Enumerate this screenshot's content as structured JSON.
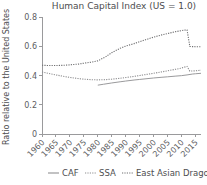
{
  "chart_data": {
    "type": "line",
    "title": "Human Capital Index (US = 1.0)",
    "xlabel": "",
    "ylabel": "Ratio relative to the United States",
    "xlim": [
      1960,
      2017
    ],
    "ylim": [
      0,
      0.8
    ],
    "xticks": [
      1960,
      1965,
      1970,
      1975,
      1980,
      1985,
      1990,
      1995,
      2000,
      2005,
      2010,
      2015
    ],
    "xtick_labels": [
      "1960",
      "1965",
      "1970",
      "1975",
      "1980",
      "1985",
      "1990",
      "1995",
      "2000",
      "2005",
      "2010",
      "2015"
    ],
    "yticks": [
      0,
      0.2,
      0.4,
      0.6,
      0.8
    ],
    "ytick_labels": [
      "0",
      "0.2",
      "0.4",
      "0.6",
      "0.8"
    ],
    "grid": false,
    "legend_position": "bottom",
    "series": [
      {
        "name": "CAF",
        "style": "solid",
        "color": "#9a9a9c",
        "x": [
          1980,
          1982,
          1985,
          1988,
          1990,
          1993,
          1995,
          1998,
          2000,
          2003,
          2005,
          2008,
          2010,
          2012,
          2014,
          2015,
          2017
        ],
        "values": [
          0.334,
          0.34,
          0.349,
          0.357,
          0.362,
          0.369,
          0.373,
          0.379,
          0.383,
          0.388,
          0.391,
          0.396,
          0.399,
          0.404,
          0.41,
          0.412,
          0.415
        ]
      },
      {
        "name": "SSA",
        "style": "dotted",
        "color": "#8e8e90",
        "x": [
          1960,
          1963,
          1965,
          1968,
          1970,
          1973,
          1975,
          1978,
          1980,
          1983,
          1985,
          1988,
          1990,
          1993,
          1995,
          1998,
          2000,
          2003,
          2005,
          2008,
          2010,
          2011,
          2012,
          2013,
          2015,
          2017
        ],
        "values": [
          0.424,
          0.412,
          0.404,
          0.393,
          0.387,
          0.379,
          0.375,
          0.371,
          0.37,
          0.372,
          0.375,
          0.381,
          0.386,
          0.394,
          0.4,
          0.409,
          0.415,
          0.425,
          0.432,
          0.443,
          0.451,
          0.457,
          0.462,
          0.43,
          0.432,
          0.436
        ]
      },
      {
        "name": "East Asian Dragons",
        "style": "dotted",
        "color": "#6f6f71",
        "x": [
          1960,
          1963,
          1965,
          1968,
          1970,
          1973,
          1975,
          1978,
          1980,
          1983,
          1985,
          1988,
          1990,
          1993,
          1995,
          1998,
          2000,
          2003,
          2005,
          2008,
          2010,
          2011,
          2012,
          2013,
          2015,
          2017
        ],
        "values": [
          0.47,
          0.468,
          0.468,
          0.47,
          0.473,
          0.478,
          0.484,
          0.492,
          0.5,
          0.53,
          0.556,
          0.586,
          0.601,
          0.618,
          0.631,
          0.65,
          0.662,
          0.678,
          0.687,
          0.7,
          0.707,
          0.71,
          0.712,
          0.598,
          0.597,
          0.597
        ]
      }
    ]
  },
  "legend": {
    "items": [
      {
        "label": "CAF",
        "style": "solid"
      },
      {
        "label": "SSA",
        "style": "dotted"
      },
      {
        "label": "East Asian Dragons",
        "style": "dotted"
      }
    ]
  }
}
